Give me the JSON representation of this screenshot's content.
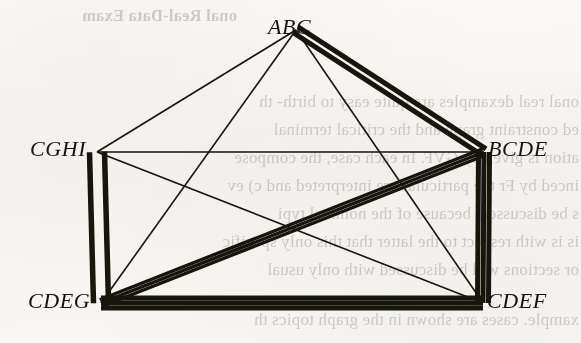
{
  "figure": {
    "type": "undirected-multigraph-diagram",
    "background_color": "#f7f6f3",
    "ink_color": "#17130f",
    "width": 581,
    "height": 343
  },
  "nodes": [
    {
      "id": "ABC",
      "label": "ABC",
      "x": 296,
      "y": 30,
      "label_x": 268,
      "label_y": 14
    },
    {
      "id": "CGHI",
      "label": "CGHI",
      "x": 97,
      "y": 152,
      "label_x": 30,
      "label_y": 136
    },
    {
      "id": "BCDE",
      "label": "BCDE",
      "x": 484,
      "y": 152,
      "label_x": 488,
      "label_y": 136
    },
    {
      "id": "CDEG",
      "label": "CDEG",
      "x": 101,
      "y": 303,
      "label_x": 28,
      "label_y": 288
    },
    {
      "id": "CDEF",
      "label": "CDEF",
      "x": 483,
      "y": 303,
      "label_x": 487,
      "label_y": 288
    }
  ],
  "edges": [
    {
      "from": "ABC",
      "to": "CGHI",
      "multiplicity": 1,
      "stroke_width": 1.6,
      "spread": 0
    },
    {
      "from": "ABC",
      "to": "BCDE",
      "multiplicity": 2,
      "stroke_width": 5.0,
      "spread": 7.5
    },
    {
      "from": "ABC",
      "to": "CDEG",
      "multiplicity": 1,
      "stroke_width": 1.6,
      "spread": 0
    },
    {
      "from": "ABC",
      "to": "CDEF",
      "multiplicity": 1,
      "stroke_width": 1.6,
      "spread": 0
    },
    {
      "from": "CGHI",
      "to": "BCDE",
      "multiplicity": 1,
      "stroke_width": 1.6,
      "spread": 0
    },
    {
      "from": "CGHI",
      "to": "CDEG",
      "multiplicity": 2,
      "stroke_width": 5.5,
      "spread": 15
    },
    {
      "from": "CGHI",
      "to": "CDEF",
      "multiplicity": 1,
      "stroke_width": 1.6,
      "spread": 0
    },
    {
      "from": "BCDE",
      "to": "CDEG",
      "multiplicity": 3,
      "stroke_width": 3.4,
      "spread": 7
    },
    {
      "from": "BCDE",
      "to": "CDEF",
      "multiplicity": 3,
      "stroke_width": 5.0,
      "spread": 11
    },
    {
      "from": "CDEG",
      "to": "CDEF",
      "multiplicity": 3,
      "stroke_width": 5.0,
      "spread": 10
    }
  ],
  "bleed_through_text": {
    "description": "faint mirrored show-through of printed text from the reverse side of the page",
    "lines": [
      {
        "text": "onal Real-Data Exam",
        "x": 344,
        "y": 6,
        "heading": true
      },
      {
        "text": "onal real  dexamples are quite easy to birth- th",
        "x": 2,
        "y": 92
      },
      {
        "text": "ed  constraint graph and the critical terminal",
        "x": 2,
        "y": 120
      },
      {
        "text": "ation is given by  GVF.  In each case, the compose",
        "x": 2,
        "y": 148
      },
      {
        "text": "inced by  Fr the particular are interpreted  and c) ev",
        "x": 2,
        "y": 176
      },
      {
        "text": "s  be discussed, because of the nominal  typi",
        "x": 2,
        "y": 204
      },
      {
        "text": "is is with respect to the latter that this  only specific",
        "x": 2,
        "y": 232
      },
      {
        "text": "or  sections will be discussed  with only usual",
        "x": 2,
        "y": 260
      },
      {
        "text": "xample. cases are shown in the  graph topics  th",
        "x": 2,
        "y": 310
      }
    ]
  }
}
